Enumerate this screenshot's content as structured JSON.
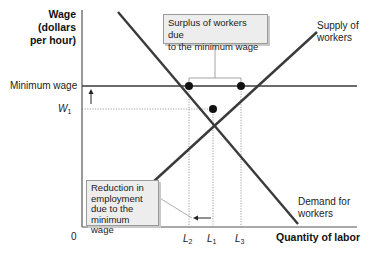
{
  "y_axis": {
    "title_line1": "Wage",
    "title_line2": "(dollars",
    "title_line3": "per hour)",
    "ticks": {
      "minimum_wage": "Minimum wage",
      "w1_letter": "W",
      "w1_sub": "1"
    }
  },
  "x_axis": {
    "title": "Quantity of labor",
    "origin": "0",
    "ticks": {
      "l2_letter": "L",
      "l2_sub": "2",
      "l1_letter": "L",
      "l1_sub": "1",
      "l3_letter": "L",
      "l3_sub": "3"
    }
  },
  "curves": {
    "supply_line1": "Supply of",
    "supply_line2": "workers",
    "demand_line1": "Demand for",
    "demand_line2": "workers"
  },
  "annotations": {
    "surplus_line1": "Surplus of workers due",
    "surplus_line2": "to the minimum wage",
    "reduction_line1": "Reduction in",
    "reduction_line2": "employment",
    "reduction_line3": "due to the",
    "reduction_line4": "minimum wage"
  },
  "colors": {
    "curve": "#3a3a3a",
    "axis": "#555555",
    "box_fill": "#ededed",
    "box_border": "#9a9a9a",
    "dotted": "#888888"
  }
}
